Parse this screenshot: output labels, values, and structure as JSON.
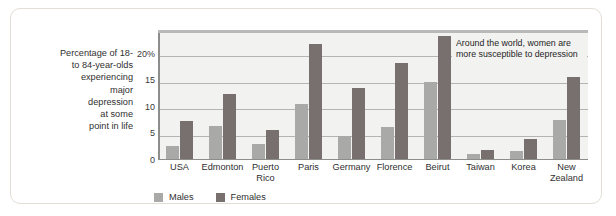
{
  "figure": {
    "axis_caption": "Percentage of 18-\nto 84-year-olds\nexperiencing\nmajor\ndepression\nat some\npoint in life",
    "annotation": "Around the world, women are more susceptible to depression",
    "colors": {
      "males": "#a9a9a7",
      "females": "#77706e",
      "plot_background": "#f2f2f0",
      "gridline": "#b4b4b2",
      "frame": "#e2ded6"
    }
  },
  "legend": {
    "position": "bottom-left",
    "items": [
      {
        "label": "Males",
        "color_key": "males"
      },
      {
        "label": "Females",
        "color_key": "females"
      }
    ]
  },
  "chart_data": {
    "type": "bar",
    "title": "",
    "subtitle": "",
    "xlabel": "",
    "ylabel": "Percentage of 18- to 84-year-olds experiencing major depression at some point in life",
    "ylim": [
      0,
      24.5
    ],
    "yticks": [
      0,
      5,
      10,
      15,
      20
    ],
    "ytick_labels": [
      "0",
      "5",
      "10",
      "15",
      "20%"
    ],
    "grid": true,
    "categories": [
      "USA",
      "Edmonton",
      "Puerto Rico",
      "Paris",
      "Germany",
      "Florence",
      "Beirut",
      "Taiwan",
      "Korea",
      "New Zealand"
    ],
    "series": [
      {
        "name": "Males",
        "color": "#a9a9a7",
        "values": [
          2.7,
          6.5,
          3.1,
          10.5,
          4.5,
          6.2,
          14.7,
          1.2,
          1.7,
          7.5
        ]
      },
      {
        "name": "Females",
        "color": "#77706e",
        "values": [
          7.4,
          12.5,
          5.6,
          21.8,
          13.6,
          18.3,
          23.4,
          1.8,
          4.0,
          15.6
        ]
      }
    ],
    "annotations": [
      {
        "text": "Around the world, women are more susceptible to depression",
        "position": "top-right"
      }
    ]
  }
}
